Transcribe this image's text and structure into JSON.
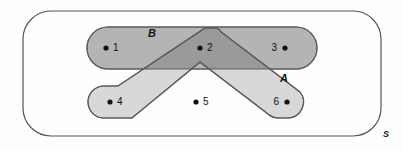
{
  "diagram": {
    "type": "venn-diagram",
    "title": "",
    "universe": {
      "label": "S",
      "name": "universal-set"
    },
    "sets": [
      {
        "id": "A",
        "label": "A",
        "shape": "chevron",
        "label_x": 284,
        "label_y": 82,
        "fill": "#d9d9d9",
        "stroke": "#555555"
      },
      {
        "id": "B",
        "label": "B",
        "shape": "rounded-rectangle",
        "label_x": 152,
        "label_y": 37,
        "fill": "#b3b3b3",
        "stroke": "#555555"
      }
    ],
    "intersection": {
      "label": "A and B",
      "fill": "#999999"
    },
    "elements": [
      {
        "label": "1",
        "dot_x": 106,
        "dot_y": 48,
        "text_x": 113,
        "text_y": 51,
        "membership": "B"
      },
      {
        "label": "2",
        "dot_x": 200,
        "dot_y": 48,
        "text_x": 207,
        "text_y": 51,
        "membership": "A and B"
      },
      {
        "label": "3",
        "dot_x": 285,
        "dot_y": 48,
        "text_x": 271,
        "text_y": 51,
        "membership": "B"
      },
      {
        "label": "4",
        "dot_x": 110,
        "dot_y": 102,
        "text_x": 117,
        "text_y": 105,
        "membership": "A and B"
      },
      {
        "label": "5",
        "dot_x": 196,
        "dot_y": 102,
        "text_x": 203,
        "text_y": 105,
        "membership": "S only"
      },
      {
        "label": "6",
        "dot_x": 287,
        "dot_y": 102,
        "text_x": 273,
        "text_y": 105,
        "membership": "A"
      }
    ],
    "colors": {
      "universe_fill": "#fefefe",
      "universe_stroke": "#555555",
      "set_a_fill": "#d9d9d9",
      "set_b_fill": "#b3b3b3",
      "intersection_fill": "#9a9a9a",
      "dot_color": "#111111",
      "text_color": "#111111"
    }
  }
}
